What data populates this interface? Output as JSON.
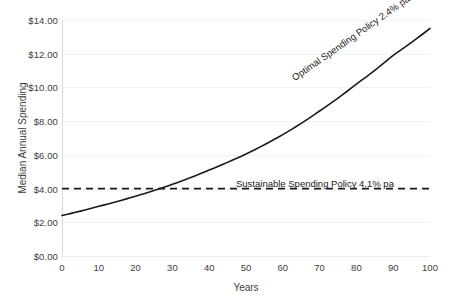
{
  "chart_data": {
    "type": "line",
    "title": "",
    "xlabel": "Years",
    "ylabel": "Median Annual Spending",
    "xlim": [
      0,
      100
    ],
    "ylim": [
      0,
      14
    ],
    "grid": true,
    "legend": "none",
    "x_ticks": [
      0,
      10,
      20,
      30,
      40,
      50,
      60,
      70,
      80,
      90,
      100
    ],
    "x_tick_labels": [
      "0",
      "10",
      "20",
      "30",
      "40",
      "50",
      "60",
      "70",
      "80",
      "90",
      "100"
    ],
    "y_ticks": [
      0,
      2,
      4,
      6,
      8,
      10,
      12,
      14
    ],
    "y_tick_labels": [
      "$0.00",
      "$2.00",
      "$4.00",
      "$6.00",
      "$8.00",
      "$10.00",
      "$12.00",
      "$14.00"
    ],
    "series": [
      {
        "name": "Optimal Spending Policy 2.4% pa",
        "style": "solid",
        "color": "#1a1a1a",
        "x": [
          0,
          10,
          20,
          30,
          40,
          50,
          60,
          70,
          80,
          90,
          100
        ],
        "values": [
          2.4,
          2.95,
          3.55,
          4.25,
          5.1,
          6.05,
          7.2,
          8.6,
          10.2,
          11.9,
          13.5
        ]
      },
      {
        "name": "Sustainable Spending Policy 4.1% pa",
        "style": "dashed",
        "color": "#1a1a1a",
        "x": [
          0,
          100
        ],
        "values": [
          4.0,
          4.0
        ]
      }
    ],
    "annotations": [
      {
        "name": "optimal-curve-label",
        "text": "Optimal Spending Policy 2.4% pa",
        "rotation": -35
      },
      {
        "name": "sustainable-line-label",
        "text": "Sustainable Spending Policy 4.1% pa",
        "rotation": 0
      }
    ],
    "crossover_year": 30
  },
  "axes": {
    "x_title": "Years",
    "y_title": "Median Annual Spending"
  }
}
